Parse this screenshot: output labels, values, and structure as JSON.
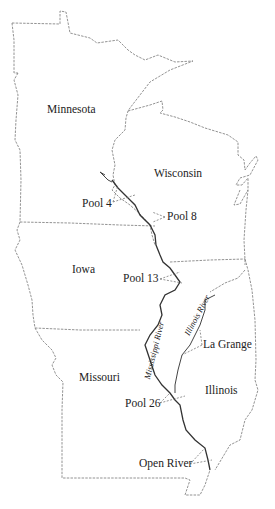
{
  "map": {
    "states": [
      {
        "id": "minnesota",
        "label": "Minnesota"
      },
      {
        "id": "wisconsin",
        "label": "Wisconsin"
      },
      {
        "id": "iowa",
        "label": "Iowa"
      },
      {
        "id": "missouri",
        "label": "Missouri"
      },
      {
        "id": "illinois",
        "label": "Illinois"
      }
    ],
    "rivers": [
      {
        "id": "mississippi",
        "label": "Mississippi River"
      },
      {
        "id": "illinois",
        "label": "Illinois River"
      }
    ],
    "sites": [
      {
        "id": "pool4",
        "label": "Pool 4"
      },
      {
        "id": "pool8",
        "label": "Pool 8"
      },
      {
        "id": "pool13",
        "label": "Pool 13"
      },
      {
        "id": "lagrange",
        "label": "La Grange"
      },
      {
        "id": "pool26",
        "label": "Pool 26"
      },
      {
        "id": "openriver",
        "label": "Open River"
      }
    ],
    "colors": {
      "background": "#ffffff",
      "outline": "#777777",
      "river": "#333333",
      "text": "#222222"
    }
  }
}
